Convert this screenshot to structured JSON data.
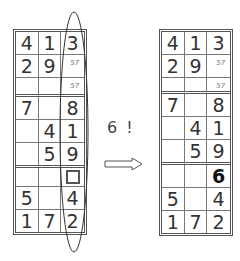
{
  "left_grid": {
    "rows": [
      [
        {
          "v": "4"
        },
        {
          "v": "1"
        },
        {
          "v": "3"
        }
      ],
      [
        {
          "v": "2"
        },
        {
          "v": "9"
        },
        {
          "cand": "57"
        }
      ],
      [
        {
          "v": ""
        },
        {
          "v": ""
        },
        {
          "cand": "57"
        }
      ],
      [
        {
          "v": "7"
        },
        {
          "v": ""
        },
        {
          "v": "8"
        }
      ],
      [
        {
          "v": ""
        },
        {
          "v": "4"
        },
        {
          "v": "1"
        }
      ],
      [
        {
          "v": ""
        },
        {
          "v": "5"
        },
        {
          "v": "9"
        }
      ],
      [
        {
          "v": ""
        },
        {
          "v": ""
        },
        {
          "box": true
        }
      ],
      [
        {
          "v": "5"
        },
        {
          "v": ""
        },
        {
          "v": "4"
        }
      ],
      [
        {
          "v": "1"
        },
        {
          "v": "7"
        },
        {
          "v": "2"
        }
      ]
    ]
  },
  "right_grid": {
    "rows": [
      [
        {
          "v": "4"
        },
        {
          "v": "1"
        },
        {
          "v": "3"
        }
      ],
      [
        {
          "v": "2"
        },
        {
          "v": "9"
        },
        {
          "cand": "57"
        }
      ],
      [
        {
          "v": ""
        },
        {
          "v": ""
        },
        {
          "cand": "57"
        }
      ],
      [
        {
          "v": "7"
        },
        {
          "v": ""
        },
        {
          "v": "8"
        }
      ],
      [
        {
          "v": ""
        },
        {
          "v": "4"
        },
        {
          "v": "1"
        }
      ],
      [
        {
          "v": ""
        },
        {
          "v": "5"
        },
        {
          "v": "9"
        }
      ],
      [
        {
          "v": ""
        },
        {
          "v": ""
        },
        {
          "v": "6",
          "bold": true
        }
      ],
      [
        {
          "v": "5"
        },
        {
          "v": ""
        },
        {
          "v": "4"
        }
      ],
      [
        {
          "v": "1"
        },
        {
          "v": "7"
        },
        {
          "v": "2"
        }
      ]
    ]
  },
  "annotation": "6 !",
  "arrow_icon": "right-arrow-icon",
  "ellipse_icon": "column-highlight-ellipse"
}
